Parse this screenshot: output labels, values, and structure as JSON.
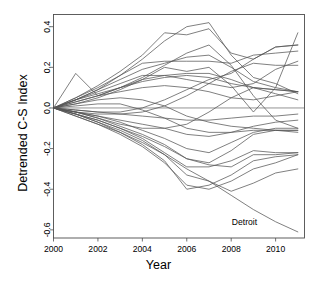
{
  "chart_data": {
    "type": "line",
    "title": "",
    "xlabel": "Year",
    "ylabel": "Detrended C-S Index",
    "xlim": [
      2000,
      2011.3
    ],
    "ylim": [
      -0.64,
      0.46
    ],
    "xticks": [
      2000,
      2002,
      2004,
      2006,
      2008,
      2010
    ],
    "xticklabels": [
      "2000",
      "2002",
      "2004",
      "2006",
      "2008",
      "2010"
    ],
    "yticks": [
      0.4,
      0.2,
      0.0,
      -0.2,
      -0.4,
      -0.6
    ],
    "yticklabels": [
      "0.4",
      "0.2",
      "0.0",
      "-0.2",
      "-0.4",
      "-0.6"
    ],
    "grid": false,
    "legend": "none",
    "reference_line_y": 0.0,
    "line_color": "#555555",
    "panel_border_color": "#4d4d4d",
    "background": "#ffffff",
    "x": [
      2000,
      2001,
      2002,
      2003,
      2004,
      2005,
      2006,
      2007,
      2008,
      2009,
      2010,
      2011
    ],
    "annotations": [
      {
        "text": "Detroit",
        "x": 2008.6,
        "y": -0.575,
        "series": "Detroit"
      }
    ],
    "series": [
      {
        "name": "Detroit",
        "values": [
          0.0,
          -0.04,
          -0.08,
          -0.12,
          -0.17,
          -0.23,
          -0.3,
          -0.36,
          -0.43,
          -0.5,
          -0.56,
          -0.61
        ]
      },
      {
        "name": "City-02",
        "values": [
          0.0,
          -0.03,
          -0.07,
          -0.11,
          -0.16,
          -0.23,
          -0.33,
          -0.36,
          -0.41,
          -0.37,
          -0.32,
          -0.3
        ]
      },
      {
        "name": "City-03",
        "values": [
          0.0,
          -0.04,
          -0.08,
          -0.13,
          -0.19,
          -0.27,
          -0.38,
          -0.4,
          -0.36,
          -0.3,
          -0.27,
          -0.23
        ]
      },
      {
        "name": "City-04",
        "values": [
          0.0,
          -0.03,
          -0.07,
          -0.12,
          -0.18,
          -0.26,
          -0.4,
          -0.38,
          -0.33,
          -0.26,
          -0.24,
          -0.23
        ]
      },
      {
        "name": "City-05",
        "values": [
          0.0,
          -0.03,
          -0.06,
          -0.1,
          -0.15,
          -0.22,
          -0.29,
          -0.29,
          -0.26,
          -0.21,
          -0.22,
          -0.22
        ]
      },
      {
        "name": "City-06",
        "values": [
          0.0,
          -0.02,
          -0.05,
          -0.09,
          -0.13,
          -0.18,
          -0.25,
          -0.27,
          -0.21,
          -0.13,
          -0.11,
          -0.11
        ]
      },
      {
        "name": "City-07",
        "values": [
          0.0,
          -0.02,
          -0.04,
          -0.07,
          -0.11,
          -0.15,
          -0.2,
          -0.22,
          -0.17,
          -0.12,
          -0.1,
          -0.1
        ]
      },
      {
        "name": "City-08",
        "values": [
          0.0,
          -0.02,
          -0.04,
          -0.06,
          -0.08,
          -0.1,
          -0.13,
          -0.14,
          -0.12,
          -0.09,
          -0.07,
          -0.06
        ]
      },
      {
        "name": "City-09",
        "values": [
          0.0,
          -0.01,
          -0.02,
          -0.03,
          -0.04,
          -0.05,
          -0.06,
          -0.06,
          -0.05,
          -0.04,
          -0.04,
          -0.03
        ]
      },
      {
        "name": "City-10",
        "values": [
          0.0,
          0.01,
          0.02,
          0.02,
          -0.01,
          -0.05,
          -0.1,
          -0.12,
          -0.12,
          -0.11,
          -0.11,
          -0.11
        ]
      },
      {
        "name": "City-11",
        "values": [
          0.0,
          0.02,
          0.04,
          0.05,
          0.04,
          0.01,
          -0.04,
          -0.07,
          -0.09,
          -0.1,
          -0.11,
          -0.12
        ]
      },
      {
        "name": "City-12",
        "values": [
          0.0,
          0.03,
          0.06,
          0.08,
          0.1,
          0.11,
          0.1,
          0.08,
          0.05,
          0.04,
          0.06,
          0.08
        ]
      },
      {
        "name": "City-13",
        "values": [
          0.0,
          0.04,
          0.07,
          0.1,
          0.13,
          0.15,
          0.16,
          0.15,
          0.12,
          0.1,
          0.09,
          0.08
        ]
      },
      {
        "name": "City-14",
        "values": [
          0.0,
          0.04,
          0.08,
          0.12,
          0.16,
          0.16,
          0.14,
          0.12,
          0.1,
          0.12,
          0.19,
          0.23
        ]
      },
      {
        "name": "City-15",
        "values": [
          0.0,
          0.17,
          0.06,
          0.1,
          0.14,
          0.16,
          0.17,
          0.17,
          0.14,
          0.1,
          0.09,
          0.08
        ]
      },
      {
        "name": "City-16",
        "values": [
          0.0,
          0.05,
          0.1,
          0.16,
          0.22,
          0.23,
          0.23,
          0.23,
          0.22,
          0.26,
          0.27,
          0.28
        ]
      },
      {
        "name": "City-17",
        "values": [
          0.0,
          0.04,
          0.09,
          0.14,
          0.19,
          0.22,
          0.25,
          0.26,
          0.2,
          0.13,
          0.1,
          0.08
        ]
      },
      {
        "name": "City-18",
        "values": [
          0.0,
          0.05,
          0.11,
          0.18,
          0.26,
          0.37,
          0.36,
          0.39,
          0.27,
          0.24,
          0.3,
          0.31
        ]
      },
      {
        "name": "City-19",
        "values": [
          0.0,
          0.04,
          0.09,
          0.16,
          0.24,
          0.33,
          0.4,
          0.42,
          0.26,
          0.15,
          0.12,
          0.07
        ]
      },
      {
        "name": "City-20",
        "values": [
          0.0,
          0.03,
          0.06,
          0.1,
          0.15,
          0.21,
          0.27,
          0.31,
          0.21,
          0.06,
          -0.06,
          -0.1
        ]
      },
      {
        "name": "City-21",
        "values": [
          0.0,
          0.02,
          0.05,
          0.09,
          0.14,
          0.2,
          0.18,
          0.2,
          0.11,
          -0.02,
          0.1,
          0.37
        ]
      },
      {
        "name": "City-22",
        "values": [
          0.0,
          -0.01,
          -0.02,
          -0.02,
          0.0,
          0.04,
          0.09,
          0.14,
          0.17,
          0.24,
          0.3,
          0.31
        ]
      },
      {
        "name": "City-23",
        "values": [
          0.0,
          -0.02,
          -0.03,
          -0.03,
          -0.02,
          0.01,
          0.06,
          0.12,
          0.18,
          0.22,
          0.21,
          0.21
        ]
      },
      {
        "name": "City-24",
        "values": [
          0.0,
          -0.02,
          -0.05,
          -0.08,
          -0.1,
          -0.1,
          -0.08,
          -0.02,
          0.05,
          0.1,
          0.07,
          0.04
        ]
      },
      {
        "name": "City-25",
        "values": [
          0.0,
          -0.03,
          -0.06,
          -0.1,
          -0.14,
          -0.19,
          -0.25,
          -0.28,
          -0.29,
          -0.23,
          -0.23,
          -0.22
        ]
      }
    ]
  },
  "axis": {
    "xlabel": "Year",
    "ylabel": "Detrended C-S Index"
  }
}
